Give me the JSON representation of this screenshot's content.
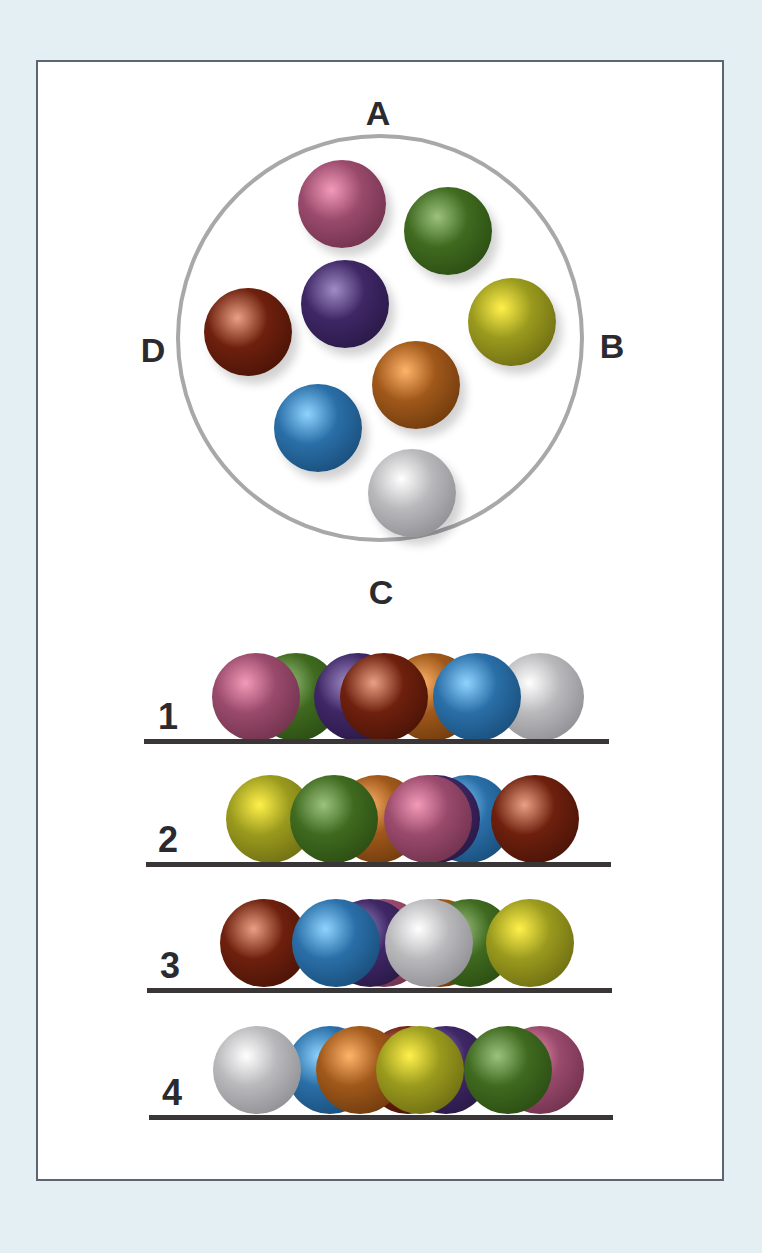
{
  "colors": {
    "background": "#e4eff3",
    "card": "#ffffff",
    "card_border": "#5d6472",
    "ring": "#a8a8ab",
    "shelf": "#3a3638",
    "text": "#2b2b2f"
  },
  "ball_palette": {
    "pink": {
      "base": "#9a4a6c",
      "light": "#f39ab8",
      "dark": "#5e2740"
    },
    "green": {
      "base": "#3f6a1f",
      "light": "#9cc27e",
      "dark": "#22400d"
    },
    "purple": {
      "base": "#3f2766",
      "light": "#a08cc6",
      "dark": "#1f1238"
    },
    "brown": {
      "base": "#6e200d",
      "light": "#e9a084",
      "dark": "#3a0e04"
    },
    "yellow": {
      "base": "#9a9a1e",
      "light": "#fff04a",
      "dark": "#5b5a0e"
    },
    "orange": {
      "base": "#a0581a",
      "light": "#ffb46a",
      "dark": "#5a2e08"
    },
    "blue": {
      "base": "#2a6fa8",
      "light": "#8fd4ff",
      "dark": "#123f66"
    },
    "white": {
      "base": "#b9b9bc",
      "light": "#ffffff",
      "dark": "#7d7d82"
    }
  },
  "top_view": {
    "labels": {
      "top": "A",
      "right": "B",
      "bottom": "C",
      "left": "D"
    },
    "ring": {
      "cx": 380,
      "cy": 338,
      "r": 204
    },
    "balls": [
      {
        "color": "pink",
        "x": 342,
        "y": 204
      },
      {
        "color": "green",
        "x": 448,
        "y": 231
      },
      {
        "color": "purple",
        "x": 345,
        "y": 304
      },
      {
        "color": "brown",
        "x": 248,
        "y": 332
      },
      {
        "color": "yellow",
        "x": 512,
        "y": 322
      },
      {
        "color": "orange",
        "x": 416,
        "y": 385
      },
      {
        "color": "blue",
        "x": 318,
        "y": 428
      },
      {
        "color": "white",
        "x": 412,
        "y": 493
      }
    ]
  },
  "options": [
    {
      "label": "1",
      "label_pos": {
        "x": 168,
        "y": 717
      },
      "shelf": {
        "x1": 144,
        "x2": 609,
        "y": 741
      },
      "ball_y": 697,
      "balls_back_to_front": [
        {
          "color": "orange",
          "x": 432
        },
        {
          "color": "green",
          "x": 296
        },
        {
          "color": "purple",
          "x": 358
        },
        {
          "color": "pink",
          "x": 256
        },
        {
          "color": "brown",
          "x": 384
        },
        {
          "color": "white",
          "x": 540
        },
        {
          "color": "blue",
          "x": 477
        }
      ]
    },
    {
      "label": "2",
      "label_pos": {
        "x": 168,
        "y": 840
      },
      "shelf": {
        "x1": 146,
        "x2": 611,
        "y": 864
      },
      "ball_y": 819,
      "balls_back_to_front": [
        {
          "color": "blue",
          "x": 468
        },
        {
          "color": "purple",
          "x": 436
        },
        {
          "color": "orange",
          "x": 378
        },
        {
          "color": "yellow",
          "x": 270
        },
        {
          "color": "green",
          "x": 334
        },
        {
          "color": "pink",
          "x": 428
        },
        {
          "color": "brown",
          "x": 535
        }
      ]
    },
    {
      "label": "3",
      "label_pos": {
        "x": 170,
        "y": 966
      },
      "shelf": {
        "x1": 147,
        "x2": 612,
        "y": 990
      },
      "ball_y": 943,
      "balls_back_to_front": [
        {
          "color": "pink",
          "x": 384
        },
        {
          "color": "purple",
          "x": 370
        },
        {
          "color": "orange",
          "x": 440
        },
        {
          "color": "green",
          "x": 470
        },
        {
          "color": "brown",
          "x": 264
        },
        {
          "color": "blue",
          "x": 336
        },
        {
          "color": "white",
          "x": 429
        },
        {
          "color": "yellow",
          "x": 530
        }
      ]
    },
    {
      "label": "4",
      "label_pos": {
        "x": 172,
        "y": 1093
      },
      "shelf": {
        "x1": 149,
        "x2": 613,
        "y": 1117
      },
      "ball_y": 1070,
      "balls_back_to_front": [
        {
          "color": "pink",
          "x": 540
        },
        {
          "color": "purple",
          "x": 446
        },
        {
          "color": "brown",
          "x": 408
        },
        {
          "color": "blue",
          "x": 330
        },
        {
          "color": "white",
          "x": 257
        },
        {
          "color": "orange",
          "x": 360
        },
        {
          "color": "green",
          "x": 508
        },
        {
          "color": "yellow",
          "x": 420
        }
      ]
    }
  ],
  "ball_radius": 44
}
